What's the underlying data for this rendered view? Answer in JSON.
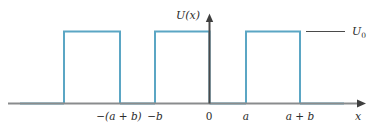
{
  "figure": {
    "axes": {
      "y_axis_label": "U(x)",
      "x_axis_label": "x",
      "origin_label": "0"
    },
    "level_line": {
      "label_base": "U",
      "label_sub": "0"
    },
    "tick_labels": [
      {
        "id": "neg-a-plus-b",
        "text": "−(a + b)",
        "x": 119
      },
      {
        "id": "neg-b",
        "text": "−b",
        "x": 155
      },
      {
        "id": "zero",
        "text": "0",
        "x": 209
      },
      {
        "id": "a",
        "text": "a",
        "x": 246
      },
      {
        "id": "a-plus-b",
        "text": "a + b",
        "x": 300
      }
    ],
    "colors": {
      "barrier_stroke": "#5ba6c4",
      "axis_gray": "#8a8c8d",
      "axis_dark": "#3f3f3f",
      "level_line": "#4a4a4a",
      "text": "#2b2b2b",
      "background": "#ffffff"
    },
    "geometry": {
      "baseline_y": 103.5,
      "top_y": 31.5,
      "barrier_height": 72,
      "x_axis_start": 8,
      "x_axis_end": 366,
      "y_axis_x": 209.5,
      "y_axis_top": 16
    },
    "barriers": [
      {
        "id": "barrier-left",
        "x1": 64,
        "x2": 120
      },
      {
        "id": "barrier-center",
        "x1": 155,
        "x2": 209.5
      },
      {
        "id": "barrier-right",
        "x1": 246,
        "x2": 300
      }
    ],
    "level_marker": {
      "x1": 306,
      "x2": 345,
      "y": 31.5,
      "label_x": 352,
      "label_y": 35
    }
  }
}
